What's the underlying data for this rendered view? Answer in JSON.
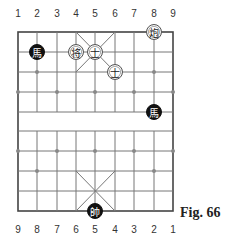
{
  "top_labels": [
    "1",
    "2",
    "3",
    "4",
    "5",
    "6",
    "7",
    "8",
    "9"
  ],
  "bottom_labels": [
    "9",
    "8",
    "7",
    "6",
    "5",
    "4",
    "3",
    "2",
    "1"
  ],
  "caption": "Fig. 66",
  "pieces": [
    {
      "side": "black",
      "glyph": "馬",
      "col": 1,
      "row": 1
    },
    {
      "side": "red",
      "glyph": "将",
      "col": 3,
      "row": 1
    },
    {
      "side": "red",
      "glyph": "士",
      "col": 4,
      "row": 1
    },
    {
      "side": "red",
      "glyph": "士",
      "col": 5,
      "row": 2
    },
    {
      "side": "red",
      "glyph": "炮",
      "col": 7,
      "row": 0
    },
    {
      "side": "black",
      "glyph": "馬",
      "col": 7,
      "row": 4
    },
    {
      "side": "black",
      "glyph": "帥",
      "col": 4,
      "row": 9
    }
  ]
}
